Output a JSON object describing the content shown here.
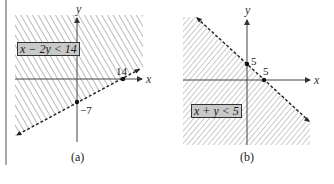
{
  "figure_a": {
    "inequality": "x − 2y < 14",
    "x_axis_label": "x",
    "y_axis_label": "y",
    "x_intercept_label": "14",
    "y_intercept_label": "−7",
    "caption": "(a)",
    "boundary": "dashed",
    "shaded_side": "above line (contains origin)"
  },
  "figure_b": {
    "inequality": "x + y < 5",
    "x_axis_label": "x",
    "y_axis_label": "y",
    "x_intercept_label": "5",
    "y_intercept_label": "5",
    "caption": "(b)",
    "boundary": "dashed",
    "shaded_side": "below line (contains origin)"
  },
  "colors": {
    "hatch": "#555555",
    "axis": "#444444",
    "label_box_fill": "#c9c9c9",
    "background": "#ffffff"
  }
}
